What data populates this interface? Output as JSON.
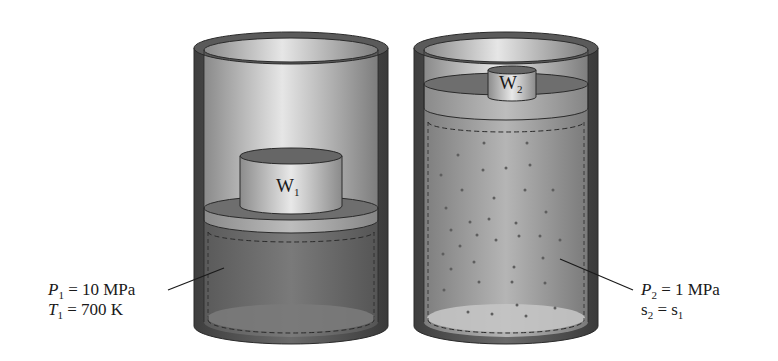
{
  "diagram": {
    "type": "piston-cylinder comparison",
    "left_state": {
      "weight_label": "W",
      "weight_subscript": "1",
      "pressure_symbol": "P",
      "pressure_subscript": "1",
      "pressure_value": "= 10 MPa",
      "temperature_symbol": "T",
      "temperature_subscript": "1",
      "temperature_value": "= 700 K"
    },
    "right_state": {
      "weight_label": "W",
      "weight_subscript": "2",
      "pressure_symbol": "P",
      "pressure_subscript": "2",
      "pressure_value": "= 1 MPa",
      "entropy_symbol": "s",
      "entropy_subscript": "2",
      "entropy_relation": "= s",
      "entropy_rhs_subscript": "1"
    },
    "colors": {
      "cylinder_wall": "#4a4a4a",
      "cylinder_inner": "#bdbdbd",
      "gas_left": "#6b6b6b",
      "gas_right": "#9a9a9a",
      "piston": "#8a8a8a",
      "weight": "#c8c8c8"
    }
  }
}
